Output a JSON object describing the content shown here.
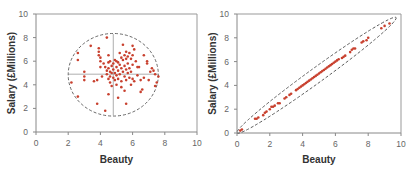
{
  "figure": {
    "title_clipped": "…ng … p…",
    "panel_left_label": "Uncorrelated",
    "panel_right_label": "Strongly correlated"
  },
  "colors": {
    "point": "#c8402e",
    "axis": "#888888",
    "frame": "#999999",
    "ellipse": "#444444",
    "crosshair": "#999999",
    "tick_label": "#666666",
    "axis_title": "#333333"
  },
  "chart_data": [
    {
      "type": "scatter",
      "title": "",
      "xlabel": "Beauty",
      "ylabel": "Salary (£Millions)",
      "xlim": [
        0,
        10
      ],
      "ylim": [
        0,
        10
      ],
      "xticks": [
        0,
        2,
        4,
        6,
        8,
        10
      ],
      "yticks": [
        0,
        2,
        4,
        6,
        8,
        10
      ],
      "grid": false,
      "annotations": {
        "ellipse": {
          "cx": 4.8,
          "cy": 4.85,
          "rx": 2.8,
          "ry": 3.5,
          "style": "dashed"
        },
        "crosshair": {
          "x": 4.8,
          "y": 4.9,
          "x_range": [
            2.0,
            7.6
          ],
          "y_range": [
            1.4,
            8.3
          ]
        }
      },
      "series": [
        {
          "name": "Observations",
          "points": [
            [
              2.2,
              4.2
            ],
            [
              2.6,
              6.7
            ],
            [
              2.6,
              6.1
            ],
            [
              2.6,
              3.0
            ],
            [
              3.0,
              5.1
            ],
            [
              3.0,
              4.4
            ],
            [
              3.0,
              4.7
            ],
            [
              3.4,
              7.3
            ],
            [
              3.6,
              4.3
            ],
            [
              3.8,
              4.4
            ],
            [
              3.8,
              2.4
            ],
            [
              3.9,
              7.1
            ],
            [
              3.9,
              6.8
            ],
            [
              3.9,
              6.5
            ],
            [
              4.0,
              6.3
            ],
            [
              4.0,
              6.0
            ],
            [
              4.0,
              5.5
            ],
            [
              4.1,
              4.7
            ],
            [
              4.2,
              5.8
            ],
            [
              4.3,
              5.5
            ],
            [
              4.3,
              1.8
            ],
            [
              4.4,
              8.0
            ],
            [
              4.4,
              5.2
            ],
            [
              4.4,
              4.9
            ],
            [
              4.5,
              6.5
            ],
            [
              4.5,
              5.9
            ],
            [
              4.5,
              5.4
            ],
            [
              4.5,
              4.5
            ],
            [
              4.5,
              3.2
            ],
            [
              4.6,
              6.0
            ],
            [
              4.6,
              5.1
            ],
            [
              4.6,
              4.7
            ],
            [
              4.6,
              4.2
            ],
            [
              4.7,
              5.6
            ],
            [
              4.7,
              5.0
            ],
            [
              4.7,
              3.9
            ],
            [
              4.8,
              5.8
            ],
            [
              4.8,
              5.3
            ],
            [
              4.8,
              4.6
            ],
            [
              4.9,
              6.1
            ],
            [
              4.9,
              5.0
            ],
            [
              4.9,
              4.4
            ],
            [
              5.0,
              6.0
            ],
            [
              5.0,
              5.5
            ],
            [
              5.0,
              4.8
            ],
            [
              5.0,
              4.0
            ],
            [
              5.1,
              5.9
            ],
            [
              5.1,
              5.2
            ],
            [
              5.1,
              4.5
            ],
            [
              5.1,
              2.9
            ],
            [
              5.2,
              6.7
            ],
            [
              5.2,
              5.7
            ],
            [
              5.2,
              4.9
            ],
            [
              5.3,
              6.3
            ],
            [
              5.3,
              5.4
            ],
            [
              5.3,
              4.3
            ],
            [
              5.3,
              3.8
            ],
            [
              5.4,
              7.4
            ],
            [
              5.4,
              6.1
            ],
            [
              5.4,
              5.1
            ],
            [
              5.5,
              6.5
            ],
            [
              5.5,
              5.6
            ],
            [
              5.5,
              4.7
            ],
            [
              5.5,
              3.5
            ],
            [
              5.6,
              6.8
            ],
            [
              5.6,
              6.2
            ],
            [
              5.6,
              5.3
            ],
            [
              5.6,
              4.4
            ],
            [
              5.6,
              2.4
            ],
            [
              5.7,
              6.4
            ],
            [
              5.7,
              5.8
            ],
            [
              5.7,
              5.0
            ],
            [
              5.8,
              6.7
            ],
            [
              5.8,
              5.4
            ],
            [
              5.8,
              4.6
            ],
            [
              5.9,
              6.2
            ],
            [
              5.9,
              5.1
            ],
            [
              5.9,
              4.0
            ],
            [
              6.0,
              7.3
            ],
            [
              6.0,
              6.5
            ],
            [
              6.0,
              5.7
            ],
            [
              6.0,
              4.5
            ],
            [
              6.1,
              7.0
            ],
            [
              6.1,
              4.3
            ],
            [
              6.2,
              6.0
            ],
            [
              6.3,
              5.5
            ],
            [
              6.3,
              4.8
            ],
            [
              6.4,
              5.5
            ],
            [
              6.5,
              4.4
            ],
            [
              6.5,
              3.4
            ],
            [
              6.6,
              3.6
            ],
            [
              6.7,
              6.5
            ],
            [
              6.7,
              4.6
            ],
            [
              6.9,
              6.0
            ],
            [
              6.9,
              5.8
            ],
            [
              7.0,
              4.4
            ],
            [
              7.1,
              5.1
            ],
            [
              7.2,
              5.4
            ],
            [
              7.3,
              5.2
            ],
            [
              7.4,
              4.9
            ],
            [
              7.4,
              3.9
            ],
            [
              7.5,
              4.2
            ],
            [
              7.6,
              4.7
            ]
          ]
        }
      ]
    },
    {
      "type": "scatter",
      "title": "",
      "xlabel": "Beauty",
      "ylabel": "Salary (£Millions)",
      "xlim": [
        0,
        10
      ],
      "ylim": [
        0,
        10
      ],
      "xticks": [
        0,
        2,
        4,
        6,
        8,
        10
      ],
      "yticks": [
        0,
        2,
        4,
        6,
        8,
        10
      ],
      "grid": false,
      "annotations": {
        "ellipse": {
          "from": [
            0.0,
            0.0
          ],
          "to": [
            9.7,
            9.7
          ],
          "half_width": 0.45,
          "style": "dashed"
        }
      },
      "series": [
        {
          "name": "Observations",
          "points": [
            [
              0.2,
              0.2
            ],
            [
              0.3,
              0.3
            ],
            [
              1.1,
              1.2
            ],
            [
              1.2,
              1.2
            ],
            [
              1.3,
              1.3
            ],
            [
              1.6,
              1.5
            ],
            [
              1.7,
              1.7
            ],
            [
              1.8,
              1.8
            ],
            [
              2.0,
              2.0
            ],
            [
              2.1,
              2.2
            ],
            [
              2.2,
              2.2
            ],
            [
              2.3,
              2.3
            ],
            [
              2.5,
              2.5
            ],
            [
              2.6,
              2.5
            ],
            [
              2.9,
              2.9
            ],
            [
              3.0,
              3.0
            ],
            [
              3.2,
              3.2
            ],
            [
              3.3,
              3.3
            ],
            [
              3.6,
              3.6
            ],
            [
              3.7,
              3.7
            ],
            [
              3.8,
              3.8
            ],
            [
              3.9,
              3.9
            ],
            [
              4.0,
              4.0
            ],
            [
              4.1,
              4.1
            ],
            [
              4.2,
              4.2
            ],
            [
              4.3,
              4.3
            ],
            [
              4.4,
              4.4
            ],
            [
              4.5,
              4.5
            ],
            [
              4.6,
              4.6
            ],
            [
              4.7,
              4.7
            ],
            [
              4.8,
              4.8
            ],
            [
              4.9,
              4.9
            ],
            [
              5.0,
              5.0
            ],
            [
              5.1,
              5.1
            ],
            [
              5.2,
              5.2
            ],
            [
              5.3,
              5.3
            ],
            [
              5.4,
              5.4
            ],
            [
              5.5,
              5.5
            ],
            [
              5.6,
              5.6
            ],
            [
              5.7,
              5.7
            ],
            [
              5.8,
              5.8
            ],
            [
              5.9,
              5.9
            ],
            [
              6.0,
              6.0
            ],
            [
              6.1,
              6.1
            ],
            [
              6.2,
              6.2
            ],
            [
              6.4,
              6.3
            ],
            [
              6.5,
              6.4
            ],
            [
              6.6,
              6.5
            ],
            [
              6.9,
              6.8
            ],
            [
              7.0,
              7.0
            ],
            [
              7.1,
              7.1
            ],
            [
              7.2,
              7.1
            ],
            [
              7.6,
              7.6
            ],
            [
              7.7,
              7.7
            ],
            [
              7.9,
              7.8
            ],
            [
              8.0,
              8.0
            ],
            [
              8.8,
              8.8
            ],
            [
              9.0,
              9.0
            ],
            [
              9.3,
              9.2
            ]
          ]
        }
      ]
    }
  ]
}
